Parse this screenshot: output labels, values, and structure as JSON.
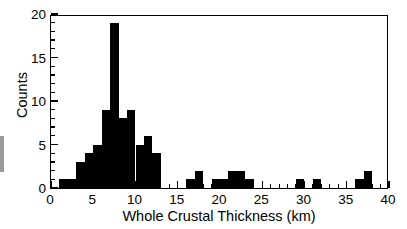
{
  "chart_data": {
    "type": "bar",
    "title": "",
    "xlabel": "Whole Crustal Thickness (km)",
    "ylabel": "Counts",
    "xlim": [
      0,
      40
    ],
    "ylim": [
      0,
      20
    ],
    "bin_width": 1,
    "grid": false,
    "legend": null,
    "bar_color": "#000000",
    "background_color": "#ffffff",
    "frame_color": "#000000",
    "xticks": [
      0,
      5,
      10,
      15,
      20,
      25,
      30,
      35,
      40
    ],
    "xtick_labels": [
      "0",
      "5",
      "10",
      "15",
      "20",
      "25",
      "30",
      "35",
      "40"
    ],
    "xminor_step": 1,
    "yticks": [
      0,
      5,
      10,
      15,
      20
    ],
    "ytick_labels": [
      "0",
      "5",
      "10",
      "15",
      "20"
    ],
    "yminor_step": 1,
    "bin_starts": [
      1,
      2,
      3,
      4,
      5,
      6,
      7,
      8,
      9,
      10,
      11,
      12,
      16,
      17,
      19,
      20,
      21,
      22,
      23,
      29,
      31,
      36,
      37
    ],
    "values": [
      1,
      1,
      3,
      4,
      5,
      9,
      19,
      8,
      9,
      5,
      6,
      4,
      1,
      2,
      1,
      1,
      2,
      2,
      1,
      1,
      1,
      1,
      2
    ],
    "categories": [
      "1-2",
      "2-3",
      "3-4",
      "4-5",
      "5-6",
      "6-7",
      "7-8",
      "8-9",
      "9-10",
      "10-11",
      "11-12",
      "12-13",
      "16-17",
      "17-18",
      "19-20",
      "20-21",
      "21-22",
      "22-23",
      "23-24",
      "29-30",
      "31-32",
      "36-37",
      "37-38"
    ],
    "series": [
      {
        "name": "Counts",
        "values": [
          1,
          1,
          3,
          4,
          5,
          9,
          19,
          8,
          9,
          5,
          6,
          4,
          1,
          2,
          1,
          1,
          2,
          2,
          1,
          1,
          1,
          1,
          2
        ]
      }
    ],
    "peak": {
      "bin": "7-8",
      "value": 19
    },
    "total_count": 89
  },
  "figure": {
    "xlabel_text": "Whole Crustal Thickness (km)",
    "ylabel_text": "Counts"
  }
}
